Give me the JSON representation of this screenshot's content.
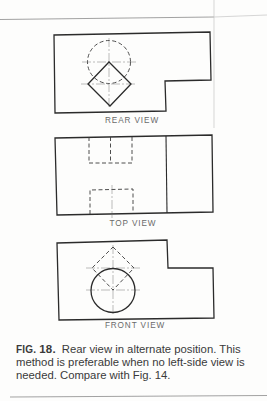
{
  "figure": {
    "views": [
      {
        "id": "rear",
        "label": "REAR VIEW"
      },
      {
        "id": "top",
        "label": "TOP VIEW"
      },
      {
        "id": "front",
        "label": "FRONT VIEW"
      }
    ]
  },
  "caption": {
    "figure_prefix": "FIG.",
    "figure_number": "18.",
    "text": "Rear view in alternate position. This method is preferable when no left-side view is needed. Compare with Fig. 14."
  }
}
